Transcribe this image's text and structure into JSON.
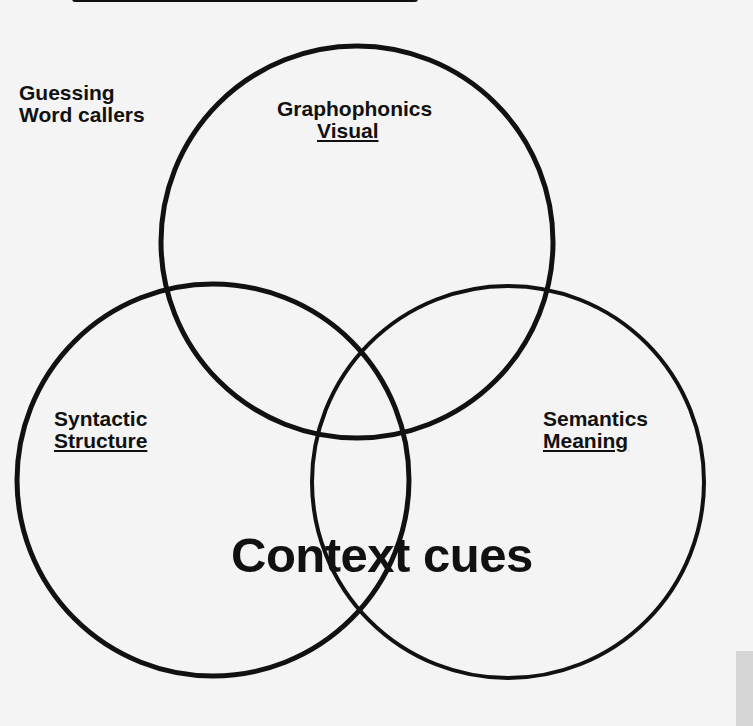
{
  "diagram": {
    "type": "venn",
    "outside_label": {
      "line1": "Guessing",
      "line2": "Word callers"
    },
    "circles": [
      {
        "id": "top",
        "title": "Graphophonics",
        "subtitle": "Visual",
        "cx": 357,
        "cy": 242,
        "r": 198
      },
      {
        "id": "left",
        "title": "Syntactic",
        "subtitle": "Structure",
        "cx": 213,
        "cy": 480,
        "r": 198
      },
      {
        "id": "right",
        "title": "Semantics",
        "subtitle": "Meaning",
        "cx": 508,
        "cy": 482,
        "r": 198
      }
    ],
    "overlap_label": "Context cues",
    "colors": {
      "stroke": "#111111",
      "background": "#f4f4f4",
      "text": "#111111"
    }
  }
}
